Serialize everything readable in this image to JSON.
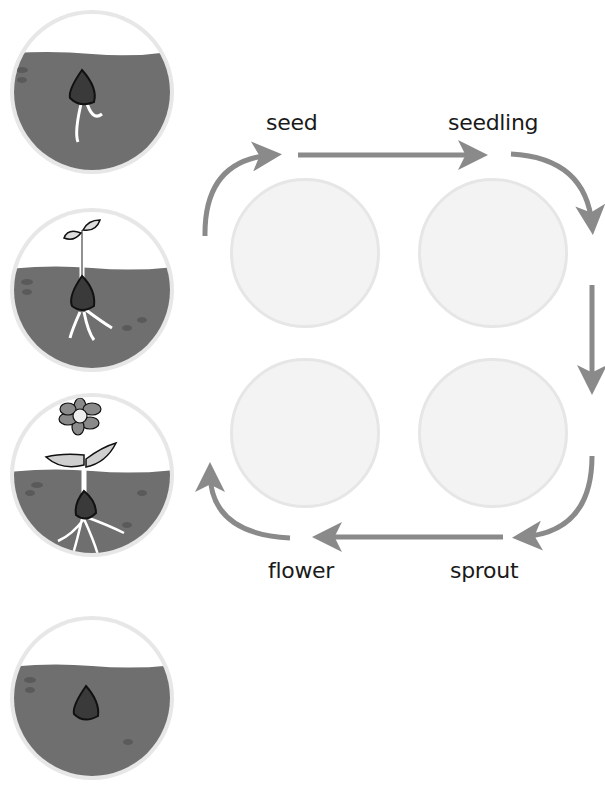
{
  "colors": {
    "soil": "#6f6f6f",
    "soil_dark": "#5a5a5a",
    "sky": "#ffffff",
    "frame": "#e7e7e7",
    "seed": "#3a3a3a",
    "arrow": "#8a8a8a",
    "slot_fill": "#f3f3f3",
    "slot_border": "#e6e6e6",
    "label": "#1a1a1a"
  },
  "picture_cards": [
    {
      "id": "card-1",
      "depicts": "seed with small roots in soil"
    },
    {
      "id": "card-2",
      "depicts": "seedling with two leaves and roots"
    },
    {
      "id": "card-3",
      "depicts": "flowering plant with roots"
    },
    {
      "id": "card-4",
      "depicts": "seed buried in soil"
    }
  ],
  "cycle": {
    "labels": {
      "seed": "seed",
      "seedling": "seedling",
      "sprout": "sprout",
      "flower": "flower"
    },
    "slots": [
      "empty",
      "empty",
      "empty",
      "empty"
    ]
  }
}
